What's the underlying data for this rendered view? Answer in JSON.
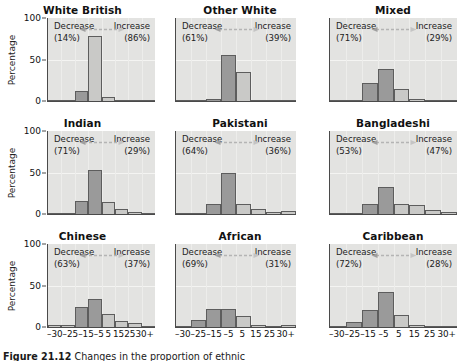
{
  "figure": {
    "caption_label": "Figure 21.12",
    "caption_text": "Changes in the proportion of ethnic"
  },
  "axes": {
    "ylabel": "Percentage",
    "yticks": [
      "100",
      "50",
      "0"
    ],
    "xticks": [
      "–30",
      "–25",
      "–15",
      "–5",
      "5",
      "15",
      "25",
      "30+"
    ]
  },
  "labels": {
    "decrease": "Decrease",
    "increase": "Increase",
    "arrow_icon": "double-headed-arrow-icon"
  },
  "colors": {
    "plot_background": "#e3e3e1",
    "bar_dark": "#9a9a9a",
    "bar_light": "#c9c9c7",
    "axis": "#4a4a4a"
  },
  "chart_data": {
    "type": "bar",
    "title": "",
    "xlabel": "",
    "ylabel": "Percentage",
    "ylim": [
      0,
      100
    ],
    "grid": true,
    "legend_position": "none",
    "categories": [
      "–30",
      "–25",
      "–15",
      "–5",
      "5",
      "15",
      "25",
      "30+"
    ],
    "panels": [
      {
        "name": "White British",
        "decrease_label": "Decrease",
        "decrease_pct": "(14%)",
        "increase_label": "Increase",
        "increase_pct": "(86%)",
        "values": [
          0.5,
          1,
          12,
          78,
          5,
          0.5,
          0.5,
          0.5
        ],
        "shades": [
          "light",
          "light",
          "dark",
          "light",
          "light",
          "light",
          "light",
          "light"
        ]
      },
      {
        "name": "Other White",
        "decrease_label": "Decrease",
        "decrease_pct": "(61%)",
        "increase_label": "Increase",
        "increase_pct": "(39%)",
        "values": [
          0.5,
          0.5,
          2,
          55,
          35,
          1,
          0.5,
          0.5
        ],
        "shades": [
          "light",
          "light",
          "dark",
          "dark",
          "light",
          "light",
          "light",
          "light"
        ]
      },
      {
        "name": "Mixed",
        "decrease_label": "Decrease",
        "decrease_pct": "(71%)",
        "increase_label": "Increase",
        "increase_pct": "(29%)",
        "values": [
          0.5,
          1,
          22,
          38,
          14,
          3,
          1,
          0.5
        ],
        "shades": [
          "light",
          "light",
          "dark",
          "dark",
          "light",
          "light",
          "light",
          "light"
        ]
      },
      {
        "name": "Indian",
        "decrease_label": "Decrease",
        "decrease_pct": "(71%)",
        "increase_label": "Increase",
        "increase_pct": "(29%)",
        "values": [
          1,
          1,
          16,
          53,
          14,
          6,
          2,
          1
        ],
        "shades": [
          "light",
          "light",
          "dark",
          "dark",
          "light",
          "light",
          "light",
          "light"
        ]
      },
      {
        "name": "Pakistani",
        "decrease_label": "Decrease",
        "decrease_pct": "(64%)",
        "increase_label": "Increase",
        "increase_pct": "(36%)",
        "values": [
          0.5,
          1,
          12,
          49,
          12,
          6,
          3,
          4
        ],
        "shades": [
          "light",
          "light",
          "dark",
          "dark",
          "light",
          "light",
          "light",
          "light"
        ]
      },
      {
        "name": "Bangladeshi",
        "decrease_label": "Decrease",
        "decrease_pct": "(53%)",
        "increase_label": "Increase",
        "increase_pct": "(47%)",
        "values": [
          0.5,
          1,
          12,
          32,
          12,
          11,
          5,
          2
        ],
        "shades": [
          "light",
          "light",
          "dark",
          "dark",
          "light",
          "light",
          "light",
          "light"
        ]
      },
      {
        "name": "Chinese",
        "decrease_label": "Decrease",
        "decrease_pct": "(63%)",
        "increase_label": "Increase",
        "increase_pct": "(37%)",
        "values": [
          2,
          3,
          24,
          34,
          16,
          7,
          5,
          1
        ],
        "shades": [
          "light",
          "light",
          "dark",
          "dark",
          "light",
          "light",
          "light",
          "light"
        ]
      },
      {
        "name": "African",
        "decrease_label": "Decrease",
        "decrease_pct": "(69%)",
        "increase_label": "Increase",
        "increase_pct": "(31%)",
        "values": [
          1,
          9,
          22,
          22,
          13,
          3,
          1,
          2
        ],
        "shades": [
          "light",
          "dark",
          "dark",
          "dark",
          "light",
          "light",
          "light",
          "light"
        ]
      },
      {
        "name": "Caribbean",
        "decrease_label": "Decrease",
        "decrease_pct": "(72%)",
        "increase_label": "Increase",
        "increase_pct": "(28%)",
        "values": [
          1,
          6,
          20,
          42,
          15,
          3,
          1,
          1
        ],
        "shades": [
          "light",
          "dark",
          "dark",
          "dark",
          "light",
          "light",
          "light",
          "light"
        ]
      }
    ]
  }
}
